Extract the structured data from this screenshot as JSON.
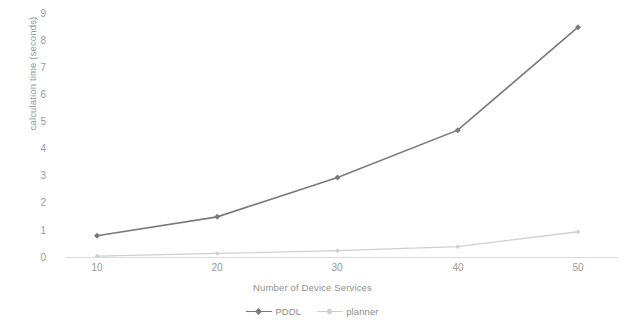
{
  "chart_data": {
    "type": "line",
    "title": "",
    "xlabel": "Number of Device Services",
    "ylabel": "calculation time (seconds)",
    "x": [
      10,
      20,
      30,
      40,
      50
    ],
    "xticklabels": [
      "10",
      "20",
      "30",
      "40",
      "50"
    ],
    "yticklabels": [
      "0",
      "1",
      "2",
      "3",
      "4",
      "5",
      "6",
      "7",
      "8",
      "9"
    ],
    "xlim": [
      5,
      55
    ],
    "ylim": [
      0,
      9
    ],
    "grid": false,
    "legend_position": "bottom",
    "series": [
      {
        "name": "PDDL",
        "color": "#7a7a7a",
        "marker": "diamond",
        "values": [
          0.8,
          1.5,
          2.95,
          4.7,
          8.5
        ]
      },
      {
        "name": "planner",
        "color": "#cfcfcf",
        "marker": "diamond",
        "values": [
          0.05,
          0.15,
          0.25,
          0.4,
          0.95
        ]
      }
    ]
  },
  "axis": {
    "baseline_color": "#d8d8d8"
  }
}
